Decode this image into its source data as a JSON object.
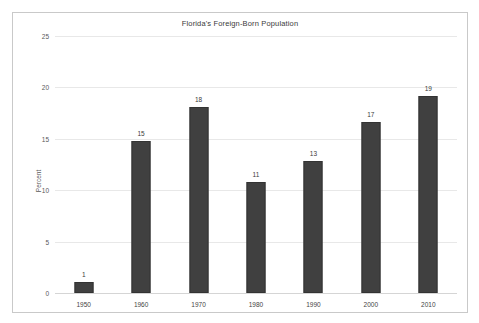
{
  "chart_data": {
    "type": "bar",
    "title": "Florida's Foreign-Born Population",
    "xlabel": "",
    "ylabel": "Percent",
    "categories": [
      "1950",
      "1960",
      "1970",
      "1980",
      "1990",
      "2000",
      "2010"
    ],
    "values": [
      1.1,
      14.8,
      18.1,
      10.8,
      12.8,
      16.6,
      19.2
    ],
    "labels": [
      "1",
      "15",
      "18",
      "11",
      "13",
      "17",
      "19"
    ],
    "ylim": [
      0,
      25
    ],
    "yticks": [
      "0",
      "5",
      "10",
      "15",
      "20",
      "25"
    ],
    "grid": true,
    "legend": "none",
    "series_color": "#404040"
  }
}
